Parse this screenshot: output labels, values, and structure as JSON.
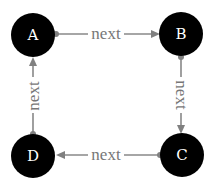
{
  "diagram": {
    "type": "directed-cycle-graph",
    "colors": {
      "node_fill": "#000000",
      "node_text": "#ffffff",
      "edge": "#888888",
      "edge_label": "#777777",
      "background": "#ffffff"
    },
    "nodes": [
      {
        "id": "A",
        "label": "A",
        "cx": 33,
        "cy": 35
      },
      {
        "id": "B",
        "label": "B",
        "cx": 181,
        "cy": 34
      },
      {
        "id": "C",
        "label": "C",
        "cx": 182,
        "cy": 155
      },
      {
        "id": "D",
        "label": "D",
        "cx": 33,
        "cy": 156
      }
    ],
    "edges": [
      {
        "from": "A",
        "to": "B",
        "label": "next"
      },
      {
        "from": "B",
        "to": "C",
        "label": "next"
      },
      {
        "from": "C",
        "to": "D",
        "label": "next"
      },
      {
        "from": "D",
        "to": "A",
        "label": "next"
      }
    ]
  }
}
